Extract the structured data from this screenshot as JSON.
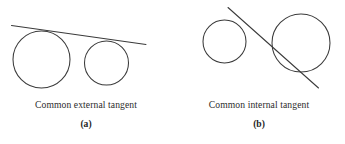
{
  "figure": {
    "background_color": "#ffffff",
    "stroke_color": "#3a3a3a",
    "text_color": "#2b2b2b",
    "panels": [
      {
        "id": "a",
        "caption": "Common external tangent",
        "letter": "(a)",
        "tangent_type": "external",
        "circles": [
          {
            "name": "large-circle",
            "cx": 41.5,
            "cy": 59.5,
            "r": 28.5
          },
          {
            "name": "small-circle",
            "cx": 106.5,
            "cy": 63.0,
            "r": 22.0
          }
        ],
        "tangent_line": {
          "x1": 11.5,
          "y1": 25.5,
          "x2": 146.0,
          "y2": 44.5
        }
      },
      {
        "id": "b",
        "caption": "Common internal tangent",
        "letter": "(b)",
        "tangent_type": "internal",
        "circles": [
          {
            "name": "small-circle",
            "cx": 224.5,
            "cy": 41.5,
            "r": 21.5
          },
          {
            "name": "large-circle",
            "cx": 301.0,
            "cy": 43.0,
            "r": 29.0
          }
        ],
        "tangent_line": {
          "x1": 228.0,
          "y1": 7.5,
          "x2": 318.5,
          "y2": 88.0
        }
      }
    ]
  }
}
